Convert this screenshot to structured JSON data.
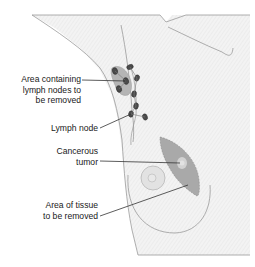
{
  "diagram": {
    "labels": {
      "lymph_area": [
        "Area containing",
        "lymph nodes to",
        "be removed"
      ],
      "lymph_node": "Lymph node",
      "tumor": [
        "Cancerous",
        "tumor"
      ],
      "tissue_area": [
        "Area of tissue",
        "to be removed"
      ]
    },
    "colors": {
      "body_fill": "#f1f1f1",
      "outline": "#8a8a8a",
      "tumor_tissue": "#a9a9a9",
      "tumor_core": "#d2d2d2",
      "lymph_area": "#b5b5b5",
      "node": "#4a4a4a",
      "leader": "#333333"
    }
  }
}
